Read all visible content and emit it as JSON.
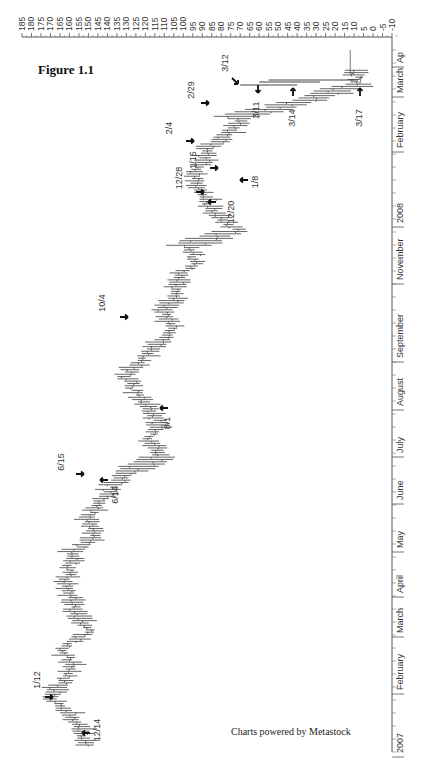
{
  "figure": {
    "title": "Figure 1.1",
    "credit": "Charts powered by Metastock"
  },
  "chart_data": {
    "type": "bar",
    "subtype": "OHLC price bars (rotated 90° — time runs bottom→top, price runs right→left)",
    "title": "Figure 1.1",
    "xlabel": "",
    "ylabel": "",
    "price_axis": {
      "position": "top",
      "ticks": [
        185,
        180,
        175,
        170,
        165,
        160,
        155,
        150,
        145,
        140,
        135,
        130,
        125,
        120,
        115,
        110,
        105,
        100,
        95,
        90,
        85,
        80,
        75,
        70,
        65,
        60,
        55,
        50,
        45,
        40,
        35,
        30,
        25,
        20,
        15,
        10,
        5,
        0,
        -5,
        -10
      ],
      "range": [
        -10,
        185
      ]
    },
    "time_axis": {
      "position": "right",
      "labels": [
        "2007",
        "February",
        "March",
        "April",
        "May",
        "June",
        "July",
        "August",
        "September",
        "November",
        "2008",
        "February",
        "March",
        "Ap"
      ]
    },
    "series": [
      {
        "name": "Price",
        "points": [
          {
            "date": "Dec 2006",
            "value": 152
          },
          {
            "date": "12/14",
            "value": 154
          },
          {
            "date": "Late Dec",
            "value": 160
          },
          {
            "date": "1/12",
            "value": 170
          },
          {
            "date": "Late Jan",
            "value": 163
          },
          {
            "date": "Feb",
            "value": 158
          },
          {
            "date": "Late Feb",
            "value": 165
          },
          {
            "date": "Mar",
            "value": 150
          },
          {
            "date": "Late Mar",
            "value": 155
          },
          {
            "date": "Apr",
            "value": 158
          },
          {
            "date": "Late Apr",
            "value": 162
          },
          {
            "date": "May",
            "value": 160
          },
          {
            "date": "Late May",
            "value": 158
          },
          {
            "date": "6/14",
            "value": 146
          },
          {
            "date": "6/15",
            "value": 150
          },
          {
            "date": "Late Jun",
            "value": 145
          },
          {
            "date": "Jul",
            "value": 138
          },
          {
            "date": "Late Jul",
            "value": 128
          },
          {
            "date": "8/1",
            "value": 112
          },
          {
            "date": "Mid Aug",
            "value": 118
          },
          {
            "date": "Late Aug",
            "value": 112
          },
          {
            "date": "Sep",
            "value": 120
          },
          {
            "date": "Late Sep",
            "value": 126
          },
          {
            "date": "10/4",
            "value": 130
          },
          {
            "date": "Mid Oct",
            "value": 120
          },
          {
            "date": "Late Oct",
            "value": 112
          },
          {
            "date": "Nov",
            "value": 106
          },
          {
            "date": "Mid Nov",
            "value": 110
          },
          {
            "date": "Late Nov",
            "value": 102
          },
          {
            "date": "Dec",
            "value": 104
          },
          {
            "date": "12/20",
            "value": 93
          },
          {
            "date": "12/28",
            "value": 96
          },
          {
            "date": "1/8",
            "value": 72
          },
          {
            "date": "1/15",
            "value": 84
          },
          {
            "date": "Late Jan",
            "value": 88
          },
          {
            "date": "2/4",
            "value": 95
          },
          {
            "date": "Mid Feb",
            "value": 90
          },
          {
            "date": "2/29",
            "value": 88
          },
          {
            "date": "3/11",
            "value": 75
          },
          {
            "date": "3/12",
            "value": 70
          },
          {
            "date": "3/14",
            "value": 35
          },
          {
            "date": "3/17",
            "value": 8
          },
          {
            "date": "Late Mar",
            "value": 10
          }
        ]
      }
    ],
    "annotations": [
      {
        "label": "12/14",
        "value": 154
      },
      {
        "label": "1/12",
        "value": 170
      },
      {
        "label": "6/14",
        "value": 146
      },
      {
        "label": "6/15",
        "value": 150
      },
      {
        "label": "8/1",
        "value": 112
      },
      {
        "label": "10/4",
        "value": 130
      },
      {
        "label": "12/20",
        "value": 93
      },
      {
        "label": "12/28",
        "value": 96
      },
      {
        "label": "1/8",
        "value": 72
      },
      {
        "label": "1/15",
        "value": 84
      },
      {
        "label": "2/4",
        "value": 95
      },
      {
        "label": "2/29",
        "value": 88
      },
      {
        "label": "3/11",
        "value": 75
      },
      {
        "label": "3/12",
        "value": 70
      },
      {
        "label": "3/14",
        "value": 35
      },
      {
        "label": "3/17",
        "value": 8
      }
    ],
    "grid": false,
    "legend": null
  }
}
